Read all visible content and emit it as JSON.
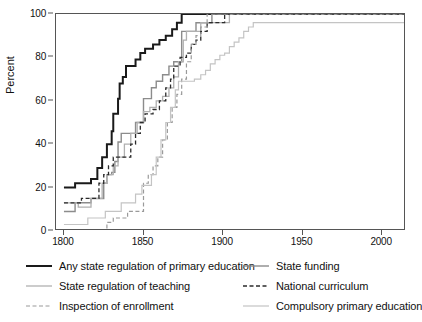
{
  "chart_data": {
    "type": "line",
    "title": "",
    "subtitle": "",
    "xlabel": "",
    "ylabel": "Percent",
    "xlim": [
      1795,
      2015
    ],
    "ylim": [
      0,
      100
    ],
    "grid": false,
    "legend_position": "below-plot, two columns, three rows",
    "x_ticks": [
      1800,
      1850,
      1900,
      1950,
      2000
    ],
    "x_tick_labels": [
      "1800",
      "1850",
      "1900",
      "1950",
      "2000"
    ],
    "y_ticks": [
      0,
      20,
      40,
      60,
      80,
      100
    ],
    "y_tick_labels": [
      "0",
      "20",
      "40",
      "60",
      "80",
      "100"
    ],
    "note": "Step (staircase) lines showing percent of countries with each form of state involvement in primary education over time.",
    "series": [
      {
        "name": "Any state regulation of primary education",
        "key": "any_state_regulation",
        "color": "#1a1a1a",
        "style": "solid",
        "width": 2.0,
        "points": [
          [
            1800,
            20
          ],
          [
            1806,
            20
          ],
          [
            1807,
            22
          ],
          [
            1816,
            22
          ],
          [
            1817,
            24
          ],
          [
            1820,
            24
          ],
          [
            1821,
            29
          ],
          [
            1823,
            29
          ],
          [
            1824,
            34
          ],
          [
            1826,
            34
          ],
          [
            1827,
            40
          ],
          [
            1829,
            40
          ],
          [
            1830,
            46
          ],
          [
            1831,
            54
          ],
          [
            1833,
            54
          ],
          [
            1834,
            61
          ],
          [
            1835,
            68
          ],
          [
            1837,
            71
          ],
          [
            1839,
            76
          ],
          [
            1843,
            76
          ],
          [
            1845,
            79
          ],
          [
            1848,
            82
          ],
          [
            1851,
            84
          ],
          [
            1856,
            86
          ],
          [
            1860,
            88
          ],
          [
            1864,
            90
          ],
          [
            1868,
            93
          ],
          [
            1871,
            96
          ],
          [
            1874,
            100
          ],
          [
            2014,
            100
          ]
        ]
      },
      {
        "name": "State funding",
        "key": "state_funding",
        "color": "#8c8c8c",
        "style": "solid",
        "width": 1.4,
        "points": [
          [
            1800,
            9
          ],
          [
            1806,
            9
          ],
          [
            1807,
            13
          ],
          [
            1816,
            13
          ],
          [
            1817,
            15
          ],
          [
            1824,
            15
          ],
          [
            1825,
            22
          ],
          [
            1827,
            26
          ],
          [
            1830,
            27
          ],
          [
            1832,
            32
          ],
          [
            1834,
            41
          ],
          [
            1836,
            45
          ],
          [
            1843,
            45
          ],
          [
            1845,
            50
          ],
          [
            1848,
            50
          ],
          [
            1850,
            61
          ],
          [
            1853,
            61
          ],
          [
            1855,
            66
          ],
          [
            1858,
            69
          ],
          [
            1862,
            72
          ],
          [
            1866,
            76
          ],
          [
            1869,
            78
          ],
          [
            1872,
            78
          ],
          [
            1874,
            92
          ],
          [
            1880,
            92
          ],
          [
            1883,
            96
          ],
          [
            1890,
            96
          ],
          [
            1893,
            100
          ],
          [
            2014,
            100
          ]
        ]
      },
      {
        "name": "State regulation of teaching",
        "key": "state_regulation_teaching",
        "color": "#b0b0b0",
        "style": "solid",
        "width": 1.3,
        "points": [
          [
            1800,
            13
          ],
          [
            1808,
            13
          ],
          [
            1809,
            11
          ],
          [
            1816,
            11
          ],
          [
            1817,
            15
          ],
          [
            1823,
            15
          ],
          [
            1824,
            22
          ],
          [
            1827,
            26
          ],
          [
            1831,
            30
          ],
          [
            1834,
            34
          ],
          [
            1838,
            40
          ],
          [
            1842,
            45
          ],
          [
            1846,
            50
          ],
          [
            1850,
            55
          ],
          [
            1854,
            57
          ],
          [
            1858,
            60
          ],
          [
            1862,
            62
          ],
          [
            1866,
            66
          ],
          [
            1869,
            71
          ],
          [
            1872,
            78
          ],
          [
            1875,
            88
          ],
          [
            1877,
            92
          ],
          [
            1884,
            92
          ],
          [
            1886,
            96
          ],
          [
            1902,
            96
          ],
          [
            1904,
            100
          ],
          [
            2014,
            100
          ]
        ]
      },
      {
        "name": "National curriculum",
        "key": "national_curriculum",
        "color": "#2b2b2b",
        "style": "dashed",
        "width": 1.3,
        "points": [
          [
            1800,
            13
          ],
          [
            1810,
            13
          ],
          [
            1811,
            15
          ],
          [
            1820,
            15
          ],
          [
            1822,
            22
          ],
          [
            1825,
            26
          ],
          [
            1828,
            30
          ],
          [
            1831,
            34
          ],
          [
            1840,
            34
          ],
          [
            1842,
            40
          ],
          [
            1845,
            45
          ],
          [
            1848,
            50
          ],
          [
            1851,
            54
          ],
          [
            1856,
            56
          ],
          [
            1858,
            56
          ],
          [
            1860,
            60
          ],
          [
            1864,
            66
          ],
          [
            1867,
            70
          ],
          [
            1869,
            76
          ],
          [
            1873,
            80
          ],
          [
            1877,
            82
          ],
          [
            1880,
            86
          ],
          [
            1883,
            88
          ],
          [
            1886,
            92
          ],
          [
            1890,
            96
          ],
          [
            1899,
            96
          ],
          [
            1901,
            100
          ],
          [
            2014,
            100
          ]
        ]
      },
      {
        "name": "Inspection of enrollment",
        "key": "inspection_of_enrollment",
        "color": "#9a9a9a",
        "style": "dashed",
        "width": 1.2,
        "points": [
          [
            1800,
            0
          ],
          [
            1826,
            0
          ],
          [
            1827,
            4
          ],
          [
            1831,
            6
          ],
          [
            1836,
            6
          ],
          [
            1840,
            9
          ],
          [
            1849,
            9
          ],
          [
            1850,
            22
          ],
          [
            1853,
            26
          ],
          [
            1856,
            30
          ],
          [
            1859,
            34
          ],
          [
            1862,
            42
          ],
          [
            1865,
            50
          ],
          [
            1868,
            57
          ],
          [
            1871,
            63
          ],
          [
            1874,
            70
          ],
          [
            1877,
            78
          ],
          [
            1880,
            86
          ],
          [
            1883,
            90
          ],
          [
            1886,
            94
          ],
          [
            1890,
            100
          ],
          [
            2014,
            100
          ]
        ]
      },
      {
        "name": "Compulsory primary education",
        "key": "compulsory_primary_education",
        "color": "#c4c4c4",
        "style": "solid",
        "width": 1.2,
        "points": [
          [
            1800,
            3
          ],
          [
            1813,
            3
          ],
          [
            1815,
            6
          ],
          [
            1824,
            6
          ],
          [
            1826,
            9
          ],
          [
            1834,
            9
          ],
          [
            1836,
            13
          ],
          [
            1843,
            13
          ],
          [
            1845,
            17
          ],
          [
            1849,
            21
          ],
          [
            1853,
            21
          ],
          [
            1855,
            26
          ],
          [
            1858,
            34
          ],
          [
            1861,
            42
          ],
          [
            1864,
            50
          ],
          [
            1867,
            57
          ],
          [
            1870,
            65
          ],
          [
            1872,
            69
          ],
          [
            1880,
            69
          ],
          [
            1882,
            70
          ],
          [
            1886,
            72
          ],
          [
            1889,
            74
          ],
          [
            1892,
            77
          ],
          [
            1895,
            79
          ],
          [
            1898,
            81
          ],
          [
            1901,
            82
          ],
          [
            1904,
            85
          ],
          [
            1907,
            87
          ],
          [
            1910,
            89
          ],
          [
            1913,
            92
          ],
          [
            1916,
            94
          ],
          [
            1919,
            96
          ],
          [
            2014,
            96
          ]
        ]
      }
    ]
  },
  "axes": {
    "y_title": "Percent",
    "y_ticks": [
      "100",
      "80",
      "60",
      "40",
      "20",
      "0"
    ],
    "x_ticks": [
      "1800",
      "1850",
      "1900",
      "1950",
      "2000"
    ]
  },
  "legend": {
    "items": [
      {
        "label": "Any state regulation of primary education",
        "key": "any_state_regulation"
      },
      {
        "label": "State funding",
        "key": "state_funding"
      },
      {
        "label": "State regulation of teaching",
        "key": "state_regulation_teaching"
      },
      {
        "label": "National curriculum",
        "key": "national_curriculum"
      },
      {
        "label": "Inspection of enrollment",
        "key": "inspection_of_enrollment"
      },
      {
        "label": "Compulsory primary education",
        "key": "compulsory_primary_education"
      }
    ]
  }
}
